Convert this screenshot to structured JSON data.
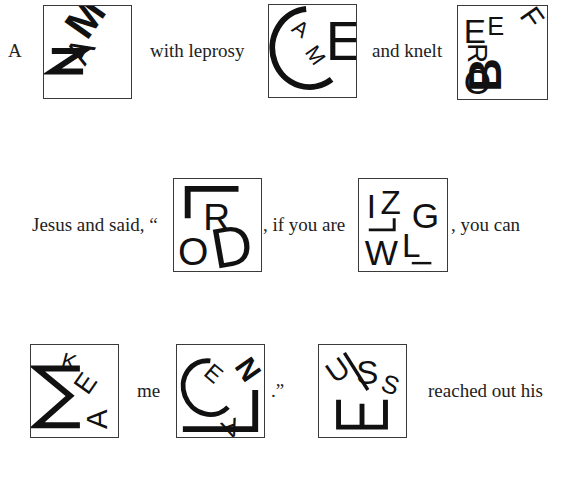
{
  "lines": [
    {
      "segments": [
        {
          "type": "text",
          "value": "A"
        },
        {
          "type": "puzzle",
          "id": "p1",
          "letters": [
            "M",
            "A",
            "N"
          ],
          "answer_hint": "MAN"
        },
        {
          "type": "text",
          "value": "with leprosy"
        },
        {
          "type": "puzzle",
          "id": "p2",
          "letters": [
            "C",
            "A",
            "M",
            "E"
          ],
          "answer_hint": "CAME"
        },
        {
          "type": "text",
          "value": "and knelt"
        },
        {
          "type": "puzzle",
          "id": "p3",
          "letters": [
            "B",
            "E",
            "F",
            "O",
            "R",
            "E"
          ],
          "answer_hint": "BEFORE"
        }
      ]
    },
    {
      "segments": [
        {
          "type": "text",
          "value": "Jesus and said, “"
        },
        {
          "type": "puzzle",
          "id": "p4",
          "letters": [
            "L",
            "O",
            "R",
            "D"
          ],
          "answer_hint": "LORD"
        },
        {
          "type": "text",
          "value": ", if you are"
        },
        {
          "type": "puzzle",
          "id": "p5",
          "letters": [
            "W",
            "I",
            "L",
            "L",
            "I",
            "N",
            "G"
          ],
          "answer_hint": "WILLING"
        },
        {
          "type": "text",
          "value": ",  you can"
        }
      ]
    },
    {
      "segments": [
        {
          "type": "puzzle",
          "id": "p6",
          "letters": [
            "M",
            "A",
            "K",
            "E"
          ],
          "answer_hint": "MAKE"
        },
        {
          "type": "text",
          "value": "me"
        },
        {
          "type": "puzzle",
          "id": "p7",
          "letters": [
            "C",
            "L",
            "E",
            "A",
            "N"
          ],
          "answer_hint": "CLEAN"
        },
        {
          "type": "text",
          "value": ".”"
        },
        {
          "type": "puzzle",
          "id": "p8",
          "letters": [
            "J",
            "E",
            "S",
            "U",
            "S"
          ],
          "answer_hint": "JESUS"
        },
        {
          "type": "text",
          "value": "reached out his"
        }
      ]
    }
  ],
  "text": {
    "l1_a": "A",
    "l1_with": "with leprosy",
    "l1_and": "and knelt",
    "l2_jesus": "Jesus and said, “",
    "l2_if": ", if you are",
    "l2_you": ",  you can",
    "l3_me": "me",
    "l3_quote": ".”",
    "l3_reached": "reached out his"
  },
  "glyphs": {
    "p1": {
      "m": "M",
      "a": "A",
      "n": "N"
    },
    "p2": {
      "c": "C",
      "a": "A",
      "m": "M",
      "e": "E"
    },
    "p3": {
      "e1": "E",
      "e2": "E",
      "f": "F",
      "r": "R",
      "o": "O",
      "b": "B"
    },
    "p4": {
      "r": "R",
      "o": "O",
      "d": "D"
    },
    "p5": {
      "i": "I",
      "z": "Z",
      "g": "G",
      "w": "W",
      "l": "L"
    },
    "p6": {
      "k": "K",
      "e": "E",
      "a": "A"
    },
    "p7": {
      "e": "E",
      "n": "N",
      "a": "A"
    },
    "p8": {
      "j": "J",
      "u": "U",
      "s1": "S",
      "s2": "S"
    }
  },
  "colors": {
    "ink": "#111111",
    "border": "#3a3a3a",
    "background": "#ffffff"
  }
}
